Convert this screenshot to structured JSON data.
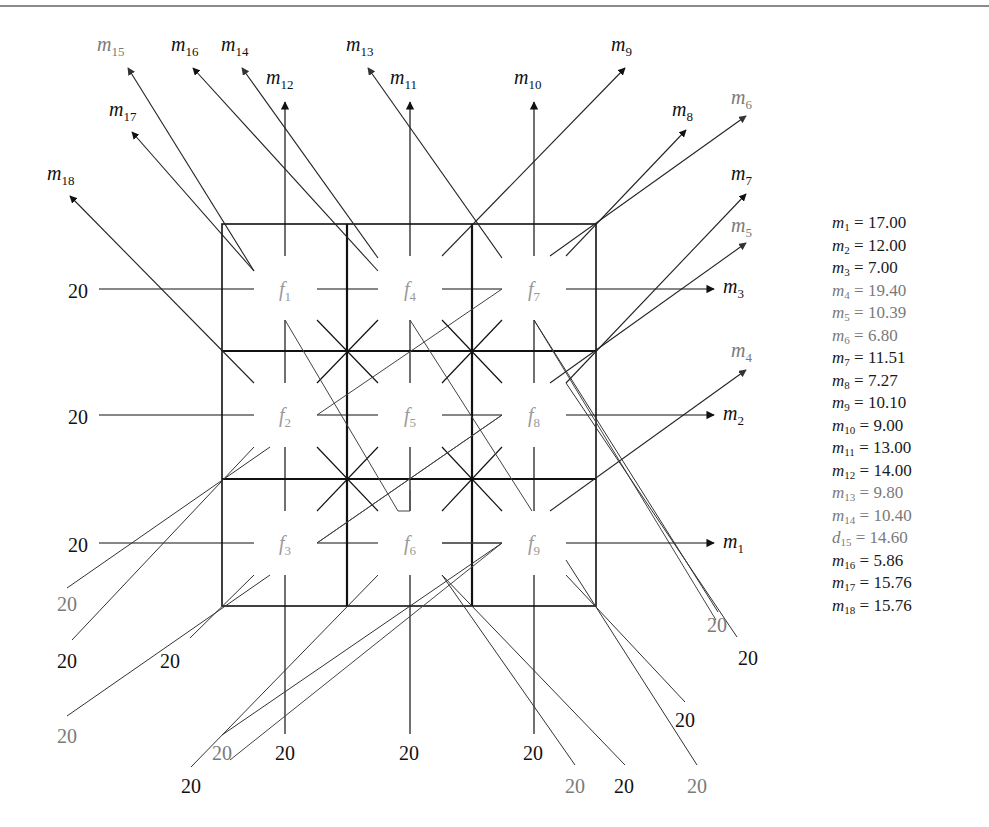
{
  "diagram": {
    "type": "flow-grid",
    "grid": {
      "cols_x": [
        222,
        347,
        472,
        596
      ],
      "rows_y": [
        224,
        351,
        479,
        606
      ],
      "line_color": "#111111"
    },
    "cells": [
      {
        "id": "f1",
        "label": "f",
        "sub": "1",
        "cx": 285,
        "cy": 289
      },
      {
        "id": "f2",
        "label": "f",
        "sub": "2",
        "cx": 285,
        "cy": 415
      },
      {
        "id": "f3",
        "label": "f",
        "sub": "3",
        "cx": 285,
        "cy": 543
      },
      {
        "id": "f4",
        "label": "f",
        "sub": "4",
        "cx": 410,
        "cy": 289
      },
      {
        "id": "f5",
        "label": "f",
        "sub": "5",
        "cx": 410,
        "cy": 415
      },
      {
        "id": "f6",
        "label": "f",
        "sub": "6",
        "cx": 410,
        "cy": 543
      },
      {
        "id": "f7",
        "label": "f",
        "sub": "7",
        "cx": 534,
        "cy": 289
      },
      {
        "id": "f8",
        "label": "f",
        "sub": "8",
        "cx": 534,
        "cy": 415
      },
      {
        "id": "f9",
        "label": "f",
        "sub": "9",
        "cx": 534,
        "cy": 543
      }
    ],
    "inflow_labels": [
      {
        "text": "20",
        "x": 78,
        "y": 298,
        "gray": false
      },
      {
        "text": "20",
        "x": 78,
        "y": 424,
        "gray": false
      },
      {
        "text": "20",
        "x": 78,
        "y": 552,
        "gray": false
      },
      {
        "text": "20",
        "x": 67,
        "y": 611,
        "gray": true
      },
      {
        "text": "20",
        "x": 67,
        "y": 668,
        "gray": false
      },
      {
        "text": "20",
        "x": 170,
        "y": 668,
        "gray": false
      },
      {
        "text": "20",
        "x": 67,
        "y": 743,
        "gray": true
      },
      {
        "text": "20",
        "x": 222,
        "y": 760,
        "gray": true
      },
      {
        "text": "20",
        "x": 191,
        "y": 793,
        "gray": false
      },
      {
        "text": "20",
        "x": 285,
        "y": 760,
        "gray": false
      },
      {
        "text": "20",
        "x": 409,
        "y": 760,
        "gray": false
      },
      {
        "text": "20",
        "x": 533,
        "y": 760,
        "gray": false
      },
      {
        "text": "20",
        "x": 575,
        "y": 793,
        "gray": true
      },
      {
        "text": "20",
        "x": 624,
        "y": 793,
        "gray": false
      },
      {
        "text": "20",
        "x": 685,
        "y": 727,
        "gray": false
      },
      {
        "text": "20",
        "x": 697,
        "y": 793,
        "gray": true
      },
      {
        "text": "20",
        "x": 717,
        "y": 632,
        "gray": true
      },
      {
        "text": "20",
        "x": 748,
        "y": 665,
        "gray": false
      }
    ],
    "outflow_arrows": [
      {
        "id": "m1",
        "label": "m",
        "sub": "1",
        "lx": 723,
        "ly": 548,
        "gray": false
      },
      {
        "id": "m2",
        "label": "m",
        "sub": "2",
        "lx": 723,
        "ly": 420,
        "gray": false
      },
      {
        "id": "m3",
        "label": "m",
        "sub": "3",
        "lx": 723,
        "ly": 293,
        "gray": false
      },
      {
        "id": "m4",
        "label": "m",
        "sub": "4",
        "lx": 731,
        "ly": 357,
        "gray": true
      },
      {
        "id": "m5",
        "label": "m",
        "sub": "5",
        "lx": 731,
        "ly": 232,
        "gray": true
      },
      {
        "id": "m6",
        "label": "m",
        "sub": "6",
        "lx": 731,
        "ly": 104,
        "gray": true
      },
      {
        "id": "m7",
        "label": "m",
        "sub": "7",
        "lx": 731,
        "ly": 180,
        "gray": false
      },
      {
        "id": "m8",
        "label": "m",
        "sub": "8",
        "lx": 672,
        "ly": 116,
        "gray": false
      },
      {
        "id": "m9",
        "label": "m",
        "sub": "9",
        "lx": 611,
        "ly": 51,
        "gray": false
      },
      {
        "id": "m10",
        "label": "m",
        "sub": "10",
        "lx": 514,
        "ly": 84,
        "gray": false
      },
      {
        "id": "m11",
        "label": "m",
        "sub": "11",
        "lx": 390,
        "ly": 84,
        "gray": false
      },
      {
        "id": "m12",
        "label": "m",
        "sub": "12",
        "lx": 266,
        "ly": 84,
        "gray": false
      },
      {
        "id": "m13",
        "label": "m",
        "sub": "13",
        "lx": 346,
        "ly": 51,
        "gray": false
      },
      {
        "id": "m14",
        "label": "m",
        "sub": "14",
        "lx": 221,
        "ly": 51,
        "gray": false
      },
      {
        "id": "m15",
        "label": "m",
        "sub": "15",
        "lx": 97,
        "ly": 51,
        "gray": true
      },
      {
        "id": "m16",
        "label": "m",
        "sub": "16",
        "lx": 171,
        "ly": 51,
        "gray": false
      },
      {
        "id": "m17",
        "label": "m",
        "sub": "17",
        "lx": 109,
        "ly": 116,
        "gray": false
      },
      {
        "id": "m18",
        "label": "m",
        "sub": "18",
        "lx": 47,
        "ly": 180,
        "gray": false
      }
    ]
  },
  "legend": {
    "items": [
      {
        "var": "m",
        "sub": "1",
        "value": "17.00",
        "gray": false
      },
      {
        "var": "m",
        "sub": "2",
        "value": "12.00",
        "gray": false
      },
      {
        "var": "m",
        "sub": "3",
        "value": "7.00",
        "gray": false
      },
      {
        "var": "m",
        "sub": "4",
        "value": "19.40",
        "gray": true
      },
      {
        "var": "m",
        "sub": "5",
        "value": "10.39",
        "gray": true
      },
      {
        "var": "m",
        "sub": "6",
        "value": "6.80",
        "gray": true
      },
      {
        "var": "m",
        "sub": "7",
        "value": "11.51",
        "gray": false
      },
      {
        "var": "m",
        "sub": "8",
        "value": "7.27",
        "gray": false
      },
      {
        "var": "m",
        "sub": "9",
        "value": "10.10",
        "gray": false
      },
      {
        "var": "m",
        "sub": "10",
        "value": "9.00",
        "gray": false
      },
      {
        "var": "m",
        "sub": "11",
        "value": "13.00",
        "gray": false
      },
      {
        "var": "m",
        "sub": "12",
        "value": "14.00",
        "gray": false
      },
      {
        "var": "m",
        "sub": "13",
        "value": "9.80",
        "gray": true
      },
      {
        "var": "m",
        "sub": "14",
        "value": "10.40",
        "gray": true
      },
      {
        "var": "d",
        "sub": "15",
        "value": "14.60",
        "gray": true
      },
      {
        "var": "m",
        "sub": "16",
        "value": "5.86",
        "gray": false
      },
      {
        "var": "m",
        "sub": "17",
        "value": "15.76",
        "gray": false
      },
      {
        "var": "m",
        "sub": "18",
        "value": "15.76",
        "gray": false
      }
    ]
  },
  "colors": {
    "dark_line": "#111111",
    "gray_line": "#555555",
    "gray_text": "#7a7a7a",
    "cell_label": "#9a9a9a",
    "top_rule": "#8a8a8a"
  }
}
